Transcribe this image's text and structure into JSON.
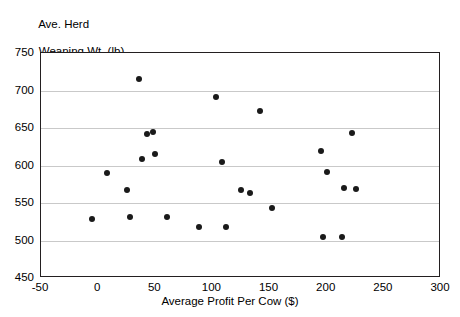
{
  "chart_data": {
    "type": "scatter",
    "title": "",
    "ylabel": "Ave. Herd\nWeaning Wt. (lb)",
    "ylabel_line1": "Ave. Herd",
    "ylabel_line2": "Weaning Wt. (lb)",
    "xlabel": "Average Profit Per Cow ($)",
    "xlim": [
      -50,
      300
    ],
    "ylim": [
      450,
      750
    ],
    "xticks": [
      -50,
      0,
      50,
      100,
      150,
      200,
      250,
      300
    ],
    "xtick_labels": [
      "-50",
      "0",
      "50",
      "100",
      "150",
      "200",
      "250",
      "300"
    ],
    "yticks": [
      450,
      500,
      550,
      600,
      650,
      700,
      750
    ],
    "ytick_labels": [
      "450",
      "500",
      "550",
      "600",
      "650",
      "700",
      "750"
    ],
    "grid": "horizontal",
    "legend": null,
    "marker_color": "#1a1a1a",
    "marker_size": 6,
    "points": [
      {
        "x": -5,
        "y": 529
      },
      {
        "x": 8,
        "y": 590
      },
      {
        "x": 25,
        "y": 567
      },
      {
        "x": 28,
        "y": 531
      },
      {
        "x": 36,
        "y": 715
      },
      {
        "x": 38,
        "y": 609
      },
      {
        "x": 43,
        "y": 642
      },
      {
        "x": 48,
        "y": 645
      },
      {
        "x": 50,
        "y": 616
      },
      {
        "x": 60,
        "y": 531
      },
      {
        "x": 88,
        "y": 518
      },
      {
        "x": 103,
        "y": 691
      },
      {
        "x": 108,
        "y": 605
      },
      {
        "x": 112,
        "y": 518
      },
      {
        "x": 125,
        "y": 568
      },
      {
        "x": 133,
        "y": 563
      },
      {
        "x": 142,
        "y": 673
      },
      {
        "x": 152,
        "y": 543
      },
      {
        "x": 195,
        "y": 620
      },
      {
        "x": 197,
        "y": 505
      },
      {
        "x": 200,
        "y": 592
      },
      {
        "x": 213,
        "y": 505
      },
      {
        "x": 215,
        "y": 570
      },
      {
        "x": 222,
        "y": 643
      },
      {
        "x": 226,
        "y": 569
      }
    ]
  }
}
